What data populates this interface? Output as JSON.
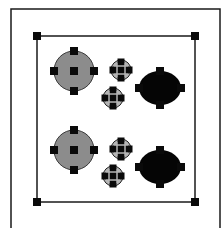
{
  "canvas": {
    "width": 221,
    "height": 228,
    "background": "#ffffff"
  },
  "colors": {
    "stroke": "#1a1a1a",
    "handle": "#0a0a0a",
    "gray_fill": "#8c8c8c",
    "light_fill": "#b5b5b5",
    "black_fill": "#050505"
  },
  "outer_frame": {
    "x": 11,
    "y": 9,
    "width": 209,
    "height": 230
  },
  "selection": {
    "x": 37,
    "y": 36,
    "width": 158,
    "height": 166,
    "handle_size": 8
  },
  "objects": [
    {
      "type": "gray-circle",
      "cx": 74,
      "cy": 71,
      "r": 20
    },
    {
      "type": "small-crosshair-circle",
      "cx": 121,
      "cy": 70,
      "r": 10
    },
    {
      "type": "small-crosshair-circle",
      "cx": 113,
      "cy": 98,
      "r": 10
    },
    {
      "type": "black-oval",
      "cx": 160,
      "cy": 88,
      "rx": 21,
      "ry": 17
    },
    {
      "type": "gray-circle",
      "cx": 74,
      "cy": 150,
      "r": 20
    },
    {
      "type": "small-crosshair-circle",
      "cx": 121,
      "cy": 149,
      "r": 10
    },
    {
      "type": "small-crosshair-circle",
      "cx": 113,
      "cy": 176,
      "r": 10
    },
    {
      "type": "black-oval",
      "cx": 160,
      "cy": 167,
      "rx": 21,
      "ry": 17
    }
  ]
}
